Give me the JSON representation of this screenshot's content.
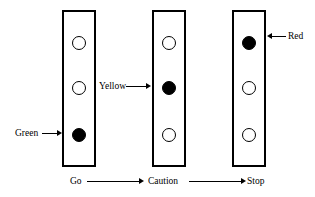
{
  "figure": {
    "background_color": "#ffffff",
    "stroke_color": "#000000"
  },
  "signals": [
    {
      "id": "signal-1",
      "lit_lamp": "bottom",
      "callout_label": "Green",
      "callout_side": "left",
      "lamps": [
        {
          "position": "top",
          "state": "off"
        },
        {
          "position": "middle",
          "state": "off"
        },
        {
          "position": "bottom",
          "state": "on"
        }
      ]
    },
    {
      "id": "signal-2",
      "lit_lamp": "middle",
      "callout_label": "Yellow",
      "callout_side": "left",
      "lamps": [
        {
          "position": "top",
          "state": "off"
        },
        {
          "position": "middle",
          "state": "on"
        },
        {
          "position": "bottom",
          "state": "off"
        }
      ]
    },
    {
      "id": "signal-3",
      "lit_lamp": "top",
      "callout_label": "Red",
      "callout_side": "right",
      "lamps": [
        {
          "position": "top",
          "state": "on"
        },
        {
          "position": "middle",
          "state": "off"
        },
        {
          "position": "bottom",
          "state": "off"
        }
      ]
    }
  ],
  "sequence": {
    "steps": [
      {
        "label": "Go"
      },
      {
        "label": "Caution"
      },
      {
        "label": "Stop"
      }
    ],
    "connector_icon": "arrow-right-icon"
  }
}
